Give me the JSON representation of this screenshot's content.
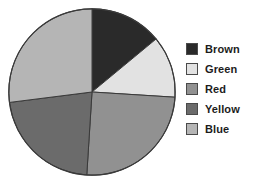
{
  "chart_data": {
    "type": "pie",
    "title": "",
    "subtitle": "",
    "xlabel": "",
    "ylabel": "",
    "grid": false,
    "legend_position": "right",
    "start_angle_deg": 0,
    "direction": "clockwise",
    "center": {
      "x": 92,
      "y": 92
    },
    "radius": 84,
    "outline_color": "#3a3a3a",
    "categories": [
      "Brown",
      "Green",
      "Red",
      "Yellow",
      "Blue"
    ],
    "values": [
      14,
      12,
      25,
      22,
      27
    ],
    "units": "percent",
    "slices": [
      {
        "label": "Brown",
        "value": 14,
        "percent": 14,
        "start_deg": 0,
        "end_deg": 50.4,
        "color": "#2a2a2a"
      },
      {
        "label": "Green",
        "value": 12,
        "percent": 12,
        "start_deg": 50.4,
        "end_deg": 93.6,
        "color": "#e2e2e2"
      },
      {
        "label": "Red",
        "value": 25,
        "percent": 25,
        "start_deg": 93.6,
        "end_deg": 183.6,
        "color": "#919191"
      },
      {
        "label": "Yellow",
        "value": 22,
        "percent": 22,
        "start_deg": 183.6,
        "end_deg": 262.8,
        "color": "#6b6b6b"
      },
      {
        "label": "Blue",
        "value": 27,
        "percent": 27,
        "start_deg": 262.8,
        "end_deg": 360,
        "color": "#b5b5b5"
      }
    ],
    "legend": [
      {
        "label": "Brown",
        "color": "#2a2a2a"
      },
      {
        "label": "Green",
        "color": "#e2e2e2"
      },
      {
        "label": "Red",
        "color": "#919191"
      },
      {
        "label": "Yellow",
        "color": "#6b6b6b"
      },
      {
        "label": "Blue",
        "color": "#b5b5b5"
      }
    ]
  },
  "legend": {
    "items": [
      {
        "label": "Brown",
        "color": "#2a2a2a"
      },
      {
        "label": "Green",
        "color": "#e2e2e2"
      },
      {
        "label": "Red",
        "color": "#919191"
      },
      {
        "label": "Yellow",
        "color": "#6b6b6b"
      },
      {
        "label": "Blue",
        "color": "#b5b5b5"
      }
    ]
  }
}
